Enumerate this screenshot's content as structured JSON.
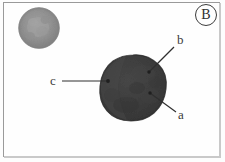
{
  "figure": {
    "panel_letter": "B",
    "panel_letter_icon": "circled-letter-icon",
    "background_color": "#fefefe",
    "frame_color": "#9a9a9a",
    "callouts": [
      {
        "id": "a",
        "label": "a",
        "label_x": 178,
        "label_y": 108,
        "line_x1": 176,
        "line_y1": 112,
        "line_x2": 150,
        "line_y2": 93,
        "dot_x": 150,
        "dot_y": 93
      },
      {
        "id": "b",
        "label": "b",
        "label_x": 177,
        "label_y": 33,
        "line_x1": 174,
        "line_y1": 47,
        "line_x2": 149,
        "line_y2": 72,
        "dot_x": 149,
        "dot_y": 72
      },
      {
        "id": "c",
        "label": "c",
        "label_x": 50,
        "label_y": 74,
        "line_x1": 62,
        "line_y1": 81,
        "line_x2": 108,
        "line_y2": 81,
        "dot_x": 108,
        "dot_y": 81
      }
    ],
    "objects": [
      {
        "id": "small-sphere",
        "name": "small-gray-sphere",
        "shape": "circle",
        "cx": 39,
        "cy": 28,
        "r": 20,
        "fill_color": "#8d8d8d",
        "inner_color": "#9a9a9a",
        "edge_color": "#7d7d7d"
      },
      {
        "id": "main-blob",
        "name": "large-dark-blob",
        "shape": "irregular-circle",
        "cx": 133,
        "cy": 88,
        "r": 33,
        "fill_color": "#3c3c3c",
        "highlight_color": "#4a4a4a",
        "shadow_color": "#303030",
        "edge_color": "#2b2b2b"
      }
    ]
  }
}
